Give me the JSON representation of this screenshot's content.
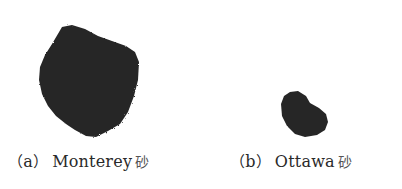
{
  "figure": {
    "panels": [
      {
        "label": "a",
        "open_paren": "（",
        "close_paren": "）",
        "name": "Monterey",
        "suffix": "砂",
        "particle_color": "#262626"
      },
      {
        "label": "b",
        "open_paren": "（",
        "close_paren": "）",
        "name": "Ottawa",
        "suffix": "砂",
        "particle_color": "#262626"
      }
    ]
  }
}
